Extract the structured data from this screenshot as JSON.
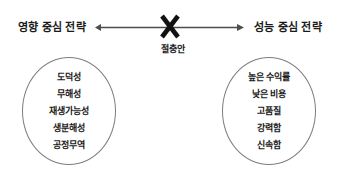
{
  "diagram": {
    "left": {
      "heading": "영향 중심 전략",
      "items": [
        "도덕성",
        "무해성",
        "재생가능성",
        "생분해성",
        "공정무역"
      ]
    },
    "right": {
      "heading": "성능 중심 전략",
      "items": [
        "높은 수익률",
        "낮은 비용",
        "고품질",
        "강력함",
        "신속함"
      ]
    },
    "center": {
      "label": "절충안",
      "marker": "x-cross-marker"
    },
    "axis": {
      "name": "double-headed-arrow",
      "color": "#4d4d4d"
    },
    "colors": {
      "text": "#1a1a1a",
      "outline": "#7d7d7d",
      "arrow": "#4d4d4d",
      "background": "#ffffff"
    }
  }
}
